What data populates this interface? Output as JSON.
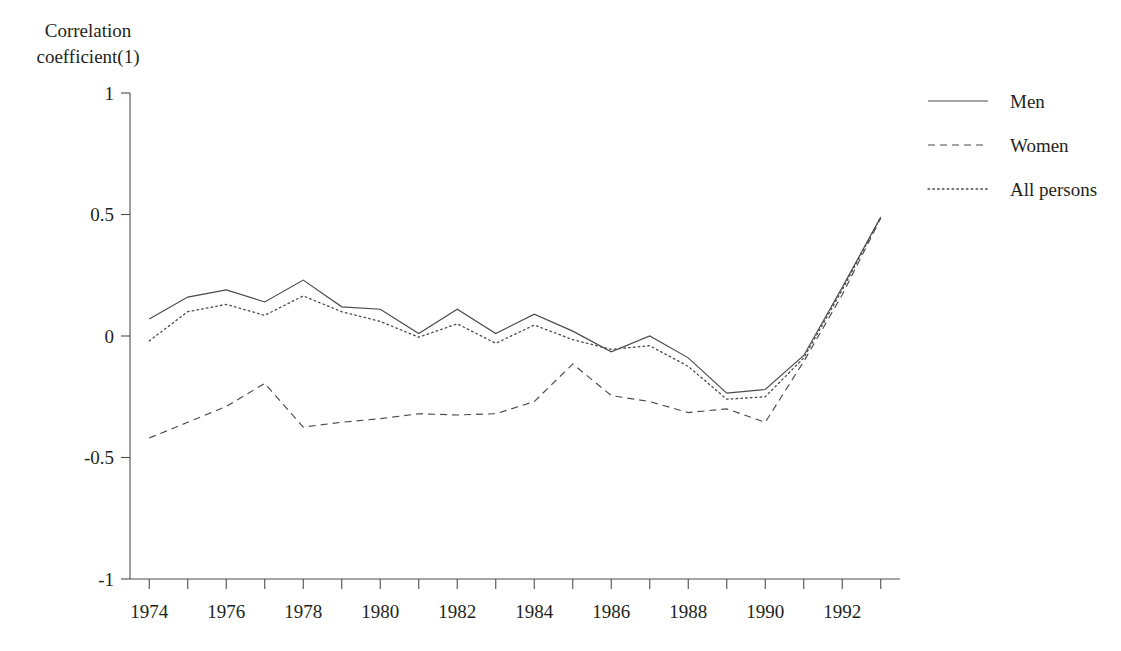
{
  "axis_label": {
    "y": "Correlation\ncoefficient(1)"
  },
  "legend": {
    "items": [
      {
        "label": "Men",
        "style": "solid"
      },
      {
        "label": "Women",
        "style": "dashed"
      },
      {
        "label": "All persons",
        "style": "dotted"
      }
    ]
  },
  "yticks": [
    "1",
    "0.5",
    "0",
    "-0.5",
    "-1"
  ],
  "xticks": [
    "1974",
    "1976",
    "1978",
    "1980",
    "1982",
    "1984",
    "1986",
    "1988",
    "1990",
    "1992"
  ],
  "chart_data": {
    "type": "line",
    "title": "",
    "xlabel": "",
    "ylabel": "Correlation coefficient(1)",
    "xlim": [
      1973.5,
      1993.5
    ],
    "ylim": [
      -1,
      1
    ],
    "yticks": [
      1,
      0.5,
      0,
      -0.5,
      -1
    ],
    "xticks_labeled": [
      1974,
      1976,
      1978,
      1980,
      1982,
      1984,
      1986,
      1988,
      1990,
      1992
    ],
    "xticks_minor_every": 1,
    "grid": false,
    "legend_position": "top-right",
    "x": [
      1974,
      1975,
      1976,
      1977,
      1978,
      1979,
      1980,
      1981,
      1982,
      1983,
      1984,
      1985,
      1986,
      1987,
      1988,
      1989,
      1990,
      1991,
      1992,
      1993
    ],
    "series": [
      {
        "name": "Men",
        "style": "solid",
        "values": [
          0.07,
          0.16,
          0.19,
          0.14,
          0.23,
          0.12,
          0.11,
          0.01,
          0.11,
          0.01,
          0.09,
          0.02,
          -0.065,
          0.0,
          -0.09,
          -0.235,
          -0.22,
          -0.08,
          0.2,
          0.49
        ]
      },
      {
        "name": "Women",
        "style": "dashed",
        "values": [
          -0.42,
          -0.355,
          -0.29,
          -0.195,
          -0.375,
          -0.355,
          -0.34,
          -0.32,
          -0.325,
          -0.32,
          -0.27,
          -0.115,
          -0.245,
          -0.27,
          -0.315,
          -0.3,
          -0.355,
          -0.105,
          0.17,
          0.485
        ]
      },
      {
        "name": "All persons",
        "style": "dotted",
        "values": [
          -0.02,
          0.1,
          0.13,
          0.085,
          0.165,
          0.1,
          0.06,
          -0.005,
          0.05,
          -0.03,
          0.045,
          -0.015,
          -0.055,
          -0.04,
          -0.125,
          -0.26,
          -0.25,
          -0.09,
          0.19,
          0.49
        ]
      }
    ]
  },
  "colors": {
    "line": "#4a4a4a",
    "axis": "#4d4d4d",
    "text": "#231f20",
    "background": "#ffffff"
  }
}
